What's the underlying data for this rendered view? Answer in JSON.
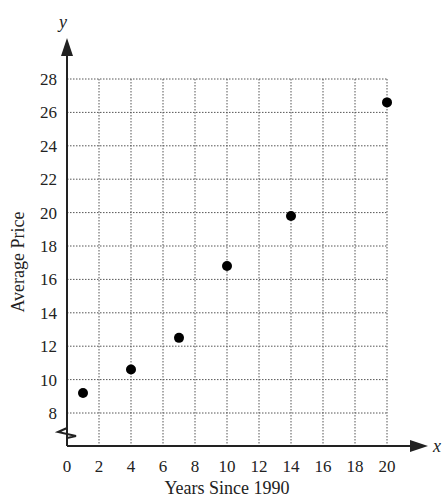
{
  "chart_data": {
    "type": "scatter",
    "title": "",
    "xlabel": "Years Since 1990",
    "ylabel": "Average Price",
    "x_axis_variable": "x",
    "y_axis_variable": "y",
    "xlim": [
      0,
      20
    ],
    "ylim": [
      8,
      28
    ],
    "y_axis_break": true,
    "grid": true,
    "grid_style": "dotted",
    "x_ticks": [
      0,
      2,
      4,
      6,
      8,
      10,
      12,
      14,
      16,
      18,
      20
    ],
    "y_ticks": [
      8,
      10,
      12,
      14,
      16,
      18,
      20,
      22,
      24,
      26,
      28
    ],
    "series": [
      {
        "name": "Average Price",
        "x": [
          1,
          4,
          7,
          10,
          14,
          20
        ],
        "y": [
          9.2,
          10.6,
          12.5,
          16.8,
          19.8,
          26.6
        ]
      }
    ],
    "legend": null
  },
  "labels": {
    "xlabel": "Years Since 1990",
    "ylabel": "Average Price",
    "xvar": "x",
    "yvar": "y"
  },
  "colors": {
    "axis": "#222222",
    "grid": "#555555",
    "point": "#000000"
  }
}
